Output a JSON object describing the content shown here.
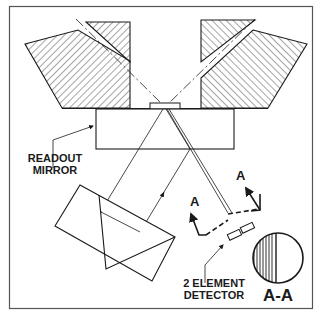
{
  "diagram": {
    "labels": {
      "readout_mirror_line1": "READOUT",
      "readout_mirror_line2": "MIRROR",
      "detector_line1": "2 ELEMENT",
      "detector_line2": "DETECTOR",
      "section_marker_left": "A",
      "section_marker_right": "A",
      "section_view": "A-A"
    },
    "colors": {
      "line": "#1a1a1a",
      "background": "#ffffff",
      "frame": "#555555"
    }
  }
}
